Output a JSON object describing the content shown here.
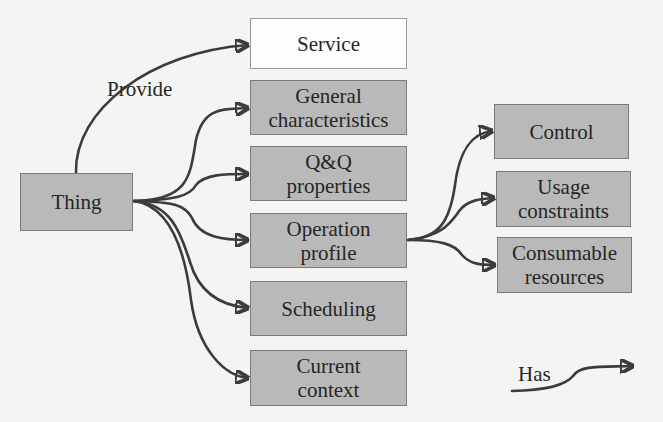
{
  "diagram": {
    "colors": {
      "background": "#f4f4f2",
      "node_fill": "#b9b9b9",
      "node_white_fill": "#fdfdfd",
      "node_border": "#7a7a7a",
      "edge": "#3c3c3c",
      "text": "#262626"
    },
    "nodes": {
      "thing": {
        "label": "Thing"
      },
      "service": {
        "label": "Service"
      },
      "general": {
        "line1": "General",
        "line2": "characteristics"
      },
      "qq": {
        "line1": "Q&Q",
        "line2": "properties"
      },
      "operation": {
        "line1": "Operation",
        "line2": "profile"
      },
      "scheduling": {
        "label": "Scheduling"
      },
      "context": {
        "line1": "Current",
        "line2": "context"
      },
      "control": {
        "label": "Control"
      },
      "usage": {
        "line1": "Usage",
        "line2": "constraints"
      },
      "consumable": {
        "line1": "Consumable",
        "line2": "resources"
      }
    },
    "edge_labels": {
      "provide": "Provide"
    },
    "legend": {
      "has_label": "Has"
    },
    "edges": [
      {
        "from": "Thing",
        "to": "Service",
        "relation": "Provide"
      },
      {
        "from": "Thing",
        "to": "General characteristics",
        "relation": "Has"
      },
      {
        "from": "Thing",
        "to": "Q&Q properties",
        "relation": "Has"
      },
      {
        "from": "Thing",
        "to": "Operation profile",
        "relation": "Has"
      },
      {
        "from": "Thing",
        "to": "Scheduling",
        "relation": "Has"
      },
      {
        "from": "Thing",
        "to": "Current context",
        "relation": "Has"
      },
      {
        "from": "Operation profile",
        "to": "Control",
        "relation": "Has"
      },
      {
        "from": "Operation profile",
        "to": "Usage constraints",
        "relation": "Has"
      },
      {
        "from": "Operation profile",
        "to": "Consumable resources",
        "relation": "Has"
      }
    ]
  }
}
